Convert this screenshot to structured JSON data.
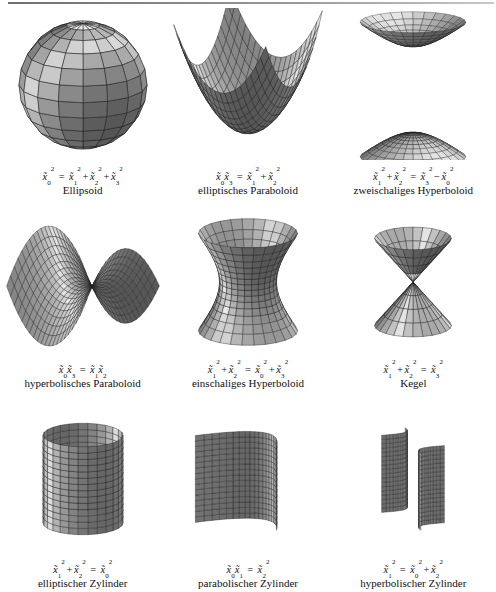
{
  "page": {
    "background": "#ffffff",
    "ink": "#111111",
    "rule_color": "#7a7a7a"
  },
  "figures": [
    {
      "id": "ellipsoid",
      "shape": "ellipsoid",
      "formula_text": "x̃0² = x̃1² + x̃2² + x̃3²",
      "formula": {
        "lhs": [
          {
            "var": "x",
            "sub": "0",
            "sup": "2"
          }
        ],
        "rel": "=",
        "rhs": [
          {
            "var": "x",
            "sub": "1",
            "sup": "2"
          },
          {
            "op": "+"
          },
          {
            "var": "x",
            "sub": "2",
            "sup": "2"
          },
          {
            "op": "+"
          },
          {
            "var": "x",
            "sub": "3",
            "sup": "2"
          }
        ]
      },
      "name": "Ellipsoid"
    },
    {
      "id": "elliptic-paraboloid",
      "shape": "elliptic-paraboloid",
      "formula_text": "x̃0 x̃3 = x̃1² + x̃2²",
      "formula": {
        "lhs": [
          {
            "var": "x",
            "sub": "0"
          },
          {
            "var": "x",
            "sub": "3"
          }
        ],
        "rel": "=",
        "rhs": [
          {
            "var": "x",
            "sub": "1",
            "sup": "2"
          },
          {
            "op": "+"
          },
          {
            "var": "x",
            "sub": "2",
            "sup": "2"
          }
        ]
      },
      "name": "elliptisches Paraboloid"
    },
    {
      "id": "two-sheeted-hyperboloid",
      "shape": "two-sheeted-hyperboloid",
      "formula_text": "x̃1² + x̃2² = x̃3² − x̃0²",
      "formula": {
        "lhs": [
          {
            "var": "x",
            "sub": "1",
            "sup": "2"
          },
          {
            "op": "+"
          },
          {
            "var": "x",
            "sub": "2",
            "sup": "2"
          }
        ],
        "rel": "=",
        "rhs": [
          {
            "var": "x",
            "sub": "3",
            "sup": "2"
          },
          {
            "op": "−"
          },
          {
            "var": "x",
            "sub": "0",
            "sup": "2"
          }
        ]
      },
      "name": "zweischaliges Hyperboloid"
    },
    {
      "id": "hyperbolic-paraboloid",
      "shape": "hyperbolic-paraboloid",
      "formula_text": "x̃0 x̃3 = x̃1 x̃2",
      "formula": {
        "lhs": [
          {
            "var": "x",
            "sub": "0"
          },
          {
            "var": "x",
            "sub": "3"
          }
        ],
        "rel": "=",
        "rhs": [
          {
            "var": "x",
            "sub": "1"
          },
          {
            "var": "x",
            "sub": "2"
          }
        ]
      },
      "name": "hyperbolisches Paraboloid"
    },
    {
      "id": "one-sheeted-hyperboloid",
      "shape": "one-sheeted-hyperboloid",
      "formula_text": "x̃1² + x̃2² = x̃0² + x̃3²",
      "formula": {
        "lhs": [
          {
            "var": "x",
            "sub": "1",
            "sup": "2"
          },
          {
            "op": "+"
          },
          {
            "var": "x",
            "sub": "2",
            "sup": "2"
          }
        ],
        "rel": "=",
        "rhs": [
          {
            "var": "x",
            "sub": "0",
            "sup": "2"
          },
          {
            "op": "+"
          },
          {
            "var": "x",
            "sub": "3",
            "sup": "2"
          }
        ]
      },
      "name": "einschaliges Hyperboloid"
    },
    {
      "id": "cone",
      "shape": "cone",
      "formula_text": "x̃1² + x̃2² = x̃3²",
      "formula": {
        "lhs": [
          {
            "var": "x",
            "sub": "1",
            "sup": "2"
          },
          {
            "op": "+"
          },
          {
            "var": "x",
            "sub": "2",
            "sup": "2"
          }
        ],
        "rel": "=",
        "rhs": [
          {
            "var": "x",
            "sub": "3",
            "sup": "2"
          }
        ]
      },
      "name": "Kegel"
    },
    {
      "id": "elliptic-cylinder",
      "shape": "elliptic-cylinder",
      "formula_text": "x̃1² + x̃2² = x̃0²",
      "formula": {
        "lhs": [
          {
            "var": "x",
            "sub": "1",
            "sup": "2"
          },
          {
            "op": "+"
          },
          {
            "var": "x",
            "sub": "2",
            "sup": "2"
          }
        ],
        "rel": "=",
        "rhs": [
          {
            "var": "x",
            "sub": "0",
            "sup": "2"
          }
        ]
      },
      "name": "elliptischer Zylinder"
    },
    {
      "id": "parabolic-cylinder",
      "shape": "parabolic-cylinder",
      "formula_text": "x̃0 x̃1 = x̃2²",
      "formula": {
        "lhs": [
          {
            "var": "x",
            "sub": "0"
          },
          {
            "var": "x",
            "sub": "1"
          }
        ],
        "rel": "=",
        "rhs": [
          {
            "var": "x",
            "sub": "2",
            "sup": "2"
          }
        ]
      },
      "name": "parabolischer Zylinder"
    },
    {
      "id": "hyperbolic-cylinder",
      "shape": "hyperbolic-cylinder",
      "formula_text": "x̃1² = x̃0² + x̃2²",
      "formula": {
        "lhs": [
          {
            "var": "x",
            "sub": "1",
            "sup": "2"
          }
        ],
        "rel": "=",
        "rhs": [
          {
            "var": "x",
            "sub": "0",
            "sup": "2"
          },
          {
            "op": "+"
          },
          {
            "var": "x",
            "sub": "2",
            "sup": "2"
          }
        ]
      },
      "name": "hyperbolischer Zylinder"
    }
  ]
}
